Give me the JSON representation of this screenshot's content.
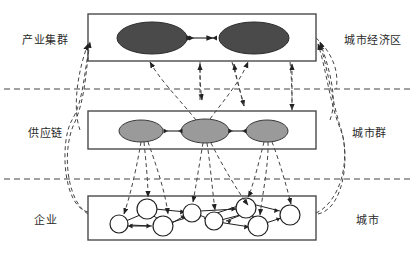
{
  "diagram": {
    "type": "three-tier-hierarchy",
    "background_color": "#ffffff",
    "line_color": "#333333",
    "tiers": [
      {
        "id": "tier-cluster",
        "left_label": "产业集群",
        "right_label": "城市经济区",
        "node_shape": "ellipse",
        "node_fill": "#4a4a4a",
        "node_count": 2
      },
      {
        "id": "tier-supply-chain",
        "left_label": "供应链",
        "right_label": "城市群",
        "node_shape": "ellipse",
        "node_fill": "#9a9a9a",
        "node_count": 3
      },
      {
        "id": "tier-enterprise",
        "left_label": "企业",
        "right_label": "城市",
        "node_shape": "circle",
        "node_fill": "#ffffff",
        "node_count": 8
      }
    ],
    "labels_left": [
      "产业集群",
      "供应链",
      "企业"
    ],
    "labels_right": [
      "城市经济区",
      "城市群",
      "城市"
    ],
    "dividers": 2
  }
}
